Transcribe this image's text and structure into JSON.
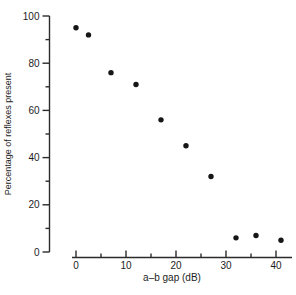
{
  "chart_data": {
    "type": "scatter",
    "title": "",
    "xlabel": "a–b gap (dB)",
    "ylabel": "Percentage of reflexes present",
    "x": [
      0,
      2.5,
      7,
      12,
      17,
      22,
      27,
      32,
      36,
      41
    ],
    "y": [
      95,
      92,
      76,
      71,
      56,
      45,
      32,
      6,
      7,
      5
    ],
    "xlim": [
      0,
      43
    ],
    "ylim": [
      0,
      100
    ],
    "x_major_ticks": [
      0,
      10,
      20,
      30,
      40
    ],
    "x_minor_ticks": [
      5,
      15,
      25,
      35
    ],
    "y_major_ticks": [
      0,
      20,
      40,
      60,
      80,
      100
    ],
    "y_minor_ticks": [
      10,
      30,
      50,
      70,
      90
    ],
    "grid": false,
    "legend": false,
    "marker_shape": "filled-circle",
    "marker_color": "#161616",
    "axis_color": "#2b2b2b",
    "text_color": "#1c1c1c",
    "background_color": "#ffffff"
  }
}
